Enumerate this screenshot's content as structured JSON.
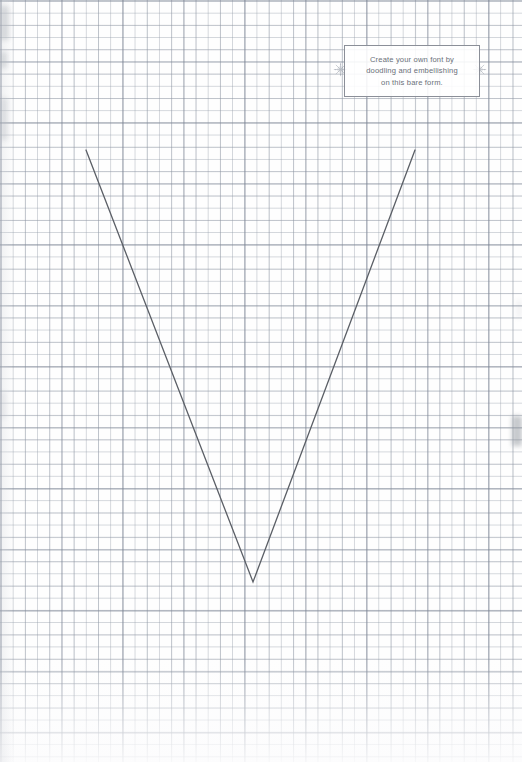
{
  "page": {
    "background_color": "#fefefe",
    "width": 522,
    "height": 762,
    "paper": {
      "type": "graph-paper",
      "cell_size_px": 12.2,
      "major_every_cells": 5,
      "grid_line_color": "#969eaa",
      "major_line_color": "#788091"
    }
  },
  "caption": {
    "line1": "Create your own font by",
    "line2": "doodling and embellishing",
    "line3": "on this bare form.",
    "full_text": "Create your own font by\ndoodling and embellishing\non this bare form.",
    "text_color": "#6a6f79",
    "border_color": "#8b8f98"
  },
  "ornaments": {
    "left": "snowflake-ornament",
    "right": "snowflake-ornament",
    "color": "#9aa0ab"
  },
  "letterform": {
    "character": "V",
    "stroke_color": "#5b5f66",
    "stroke_width_px": 1.3,
    "points": {
      "left_top": {
        "x": 86,
        "y": 150
      },
      "apex": {
        "x": 253,
        "y": 582
      },
      "right_top": {
        "x": 415,
        "y": 150
      }
    }
  }
}
